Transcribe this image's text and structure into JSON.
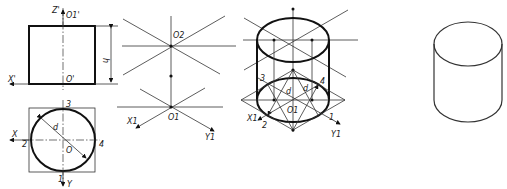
{
  "figure": {
    "front_view": {
      "labels": {
        "z_axis": "Z'",
        "top_center": "O1'",
        "bottom_center": "O'",
        "x_axis": "X'",
        "height": "h"
      }
    },
    "top_view": {
      "labels": {
        "x_axis": "X",
        "y_axis": "Y",
        "center": "O",
        "diameter": "d",
        "p1": "1",
        "p2": "2",
        "p3": "3",
        "p4": "4"
      }
    },
    "axes_construction": {
      "labels": {
        "top_center": "O2",
        "bottom_center": "O1",
        "x_axis": "X1",
        "y_axis": "Y1"
      }
    },
    "isometric_construction": {
      "labels": {
        "center": "O1",
        "x_axis": "X1",
        "y_axis": "Y1",
        "diameter": "d",
        "p1": "1",
        "p2": "2",
        "p3": "3",
        "p4": "4"
      }
    },
    "final_cylinder": {}
  }
}
